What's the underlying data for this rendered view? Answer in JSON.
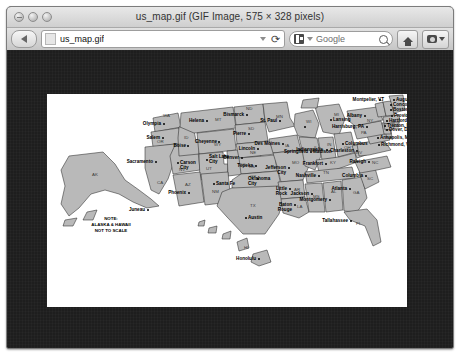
{
  "window": {
    "title": "us_map.gif (GIF Image, 575 × 328 pixels)",
    "traffic_lights": [
      "close",
      "minimize",
      "zoom"
    ]
  },
  "toolbar": {
    "back_label": "◀",
    "url_value": "us_map.gif",
    "url_placeholder": "Enter address",
    "reload_label": "⟳",
    "dropdown_label": "▾",
    "search_engine": "Google",
    "search_value": "",
    "search_placeholder": "Google",
    "home_label": "Home",
    "menu_label": "Snapshot"
  },
  "image": {
    "filename": "us_map.gif",
    "pixel_width": 575,
    "pixel_height": 328,
    "background": "#ffffff",
    "land_fill": "#b9b9b9",
    "stroke": "#2b2b2b",
    "note": [
      "NOTE:",
      "ALASKA & HAWAII",
      "NOT TO SCALE"
    ],
    "states": [
      {
        "abbr": "WA",
        "capital": "Olympia"
      },
      {
        "abbr": "OR",
        "capital": "Salem"
      },
      {
        "abbr": "CA",
        "capital": "Sacramento"
      },
      {
        "abbr": "NV",
        "capital": "Carson City"
      },
      {
        "abbr": "ID",
        "capital": "Boise"
      },
      {
        "abbr": "MT",
        "capital": "Helena"
      },
      {
        "abbr": "WY",
        "capital": "Cheyenne"
      },
      {
        "abbr": "UT",
        "capital": "Salt Lake City"
      },
      {
        "abbr": "AZ",
        "capital": "Phoenix"
      },
      {
        "abbr": "CO",
        "capital": "Denver"
      },
      {
        "abbr": "NM",
        "capital": "Santa Fe"
      },
      {
        "abbr": "ND",
        "capital": "Bismarck"
      },
      {
        "abbr": "SD",
        "capital": "Pierre"
      },
      {
        "abbr": "NE",
        "capital": "Lincoln"
      },
      {
        "abbr": "KS",
        "capital": "Topeka"
      },
      {
        "abbr": "OK",
        "capital": "Oklahoma City"
      },
      {
        "abbr": "TX",
        "capital": "Austin"
      },
      {
        "abbr": "MN",
        "capital": "St. Paul"
      },
      {
        "abbr": "IA",
        "capital": "Des Moines"
      },
      {
        "abbr": "MO",
        "capital": "Jefferson City"
      },
      {
        "abbr": "AR",
        "capital": "Little Rock"
      },
      {
        "abbr": "LA",
        "capital": "Baton Rouge"
      },
      {
        "abbr": "WI",
        "capital": "Madison"
      },
      {
        "abbr": "IL",
        "capital": "Springfield"
      },
      {
        "abbr": "MI",
        "capital": "Lansing"
      },
      {
        "abbr": "IN",
        "capital": "Indianapolis"
      },
      {
        "abbr": "OH",
        "capital": "Columbus"
      },
      {
        "abbr": "KY",
        "capital": "Frankfort"
      },
      {
        "abbr": "TN",
        "capital": "Nashville"
      },
      {
        "abbr": "MS",
        "capital": "Jackson"
      },
      {
        "abbr": "AL",
        "capital": "Montgomery"
      },
      {
        "abbr": "GA",
        "capital": "Atlanta"
      },
      {
        "abbr": "FL",
        "capital": "Tallahassee"
      },
      {
        "abbr": "SC",
        "capital": "Columbia"
      },
      {
        "abbr": "NC",
        "capital": "Raleigh"
      },
      {
        "abbr": "WV",
        "capital": "Charleston"
      },
      {
        "abbr": "VA",
        "capital": "Richmond, VA"
      },
      {
        "abbr": "MD",
        "capital": "Annapolis, MD"
      },
      {
        "abbr": "DE",
        "capital": "Dover, DE"
      },
      {
        "abbr": "NJ",
        "capital": "Trenton, NJ"
      },
      {
        "abbr": "PA",
        "capital": "Harrisburg, PA"
      },
      {
        "abbr": "NY",
        "capital": "Albany"
      },
      {
        "abbr": "CT",
        "capital": "Hartford, CT"
      },
      {
        "abbr": "RI",
        "capital": "Providence"
      },
      {
        "abbr": "MA",
        "capital": "Boston, MA"
      },
      {
        "abbr": "NH",
        "capital": "Concord"
      },
      {
        "abbr": "ME",
        "capital": "Augusta"
      },
      {
        "abbr": "VT",
        "capital": "Montpelier, VT"
      },
      {
        "abbr": "AK",
        "capital": "Juneau"
      },
      {
        "abbr": "HI",
        "capital": "Honolulu"
      }
    ]
  }
}
